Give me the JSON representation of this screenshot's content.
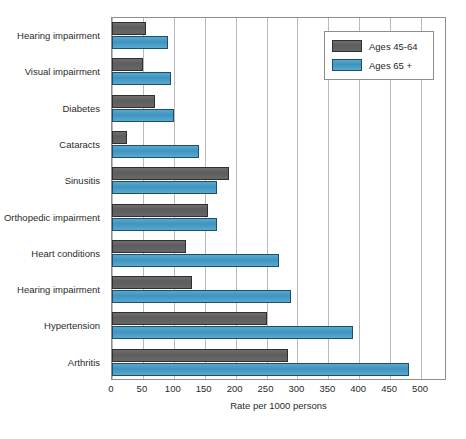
{
  "chart_data": {
    "type": "bar",
    "orientation": "horizontal",
    "title": "",
    "xlabel": "Rate per 1000 persons",
    "ylabel": "",
    "xlim": [
      0,
      542
    ],
    "xticks": [
      0,
      50,
      100,
      150,
      200,
      250,
      300,
      350,
      400,
      450,
      500
    ],
    "xtick_labels": [
      "0",
      "50",
      "100",
      "150",
      "200",
      "250",
      "300",
      "350",
      "400",
      "450",
      "500"
    ],
    "grid": true,
    "grid_axis": "x",
    "legend_position": "top-right",
    "categories": [
      "Hearing impairment",
      "Visual impairment",
      "Diabetes",
      "Cataracts",
      "Sinusitis",
      "Orthopedic impairment",
      "Heart conditions",
      "Hearing impairment",
      "Hypertension",
      "Arthritis"
    ],
    "series": [
      {
        "name": "Ages 45-64",
        "color": "#5d5d5d",
        "values": [
          55,
          50,
          70,
          25,
          190,
          155,
          120,
          130,
          250,
          285
        ]
      },
      {
        "name": "Ages 65 +",
        "color": "#3f94c0",
        "values": [
          90,
          95,
          100,
          140,
          170,
          170,
          270,
          290,
          390,
          480
        ]
      }
    ]
  },
  "legend": {
    "items": [
      {
        "label": "Ages 45-64",
        "swatch": "gray-swatch"
      },
      {
        "label": "Ages 65 +",
        "swatch": "blue-swatch"
      }
    ]
  },
  "axis": {
    "x_title": "Rate per 1000 persons"
  }
}
